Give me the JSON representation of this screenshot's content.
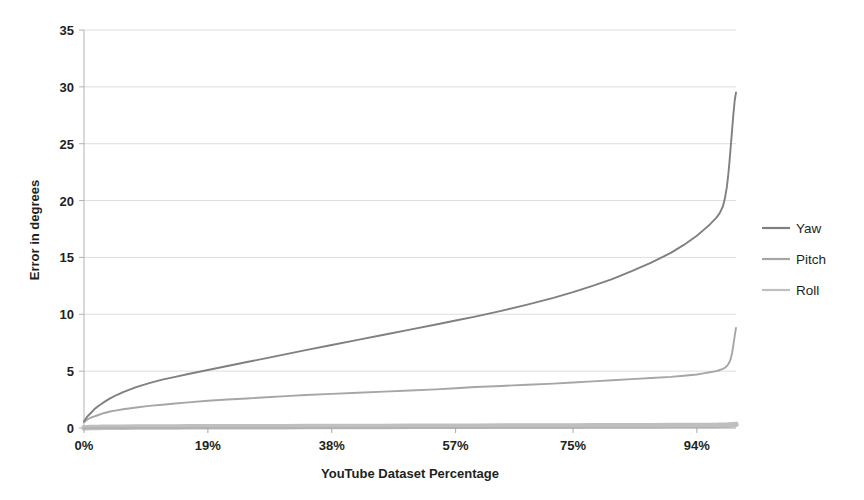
{
  "chart_data": {
    "type": "line",
    "title": "",
    "xlabel": "YouTube Dataset Percentage",
    "ylabel": "Error in degrees",
    "xtick_labels": [
      "0%",
      "19%",
      "38%",
      "57%",
      "75%",
      "94%"
    ],
    "xtick_values": [
      0,
      19,
      38,
      57,
      75,
      94
    ],
    "ytick_labels": [
      "0",
      "5",
      "10",
      "15",
      "20",
      "25",
      "30",
      "35"
    ],
    "ytick_values": [
      0,
      5,
      10,
      15,
      20,
      25,
      30,
      35
    ],
    "xlim": [
      0,
      100
    ],
    "ylim": [
      0,
      35
    ],
    "grid": "horizontal",
    "legend_position": "right",
    "legend": [
      "Yaw",
      "Pitch",
      "Roll"
    ],
    "colors": {
      "yaw": "#808080",
      "pitch": "#a6a6a6",
      "roll": "#bfbfbf",
      "axis": "#808080",
      "grid": "#d9d9d9",
      "text": "#231f20"
    },
    "x": [
      0,
      0.5,
      1,
      1.5,
      2,
      3,
      4,
      5,
      6,
      8,
      10,
      12,
      14,
      16,
      19,
      22,
      25,
      28,
      31,
      34,
      38,
      42,
      46,
      50,
      54,
      57,
      60,
      64,
      68,
      72,
      75,
      78,
      81,
      84,
      87,
      90,
      92,
      94,
      95,
      96,
      97,
      97.5,
      98,
      98.3,
      98.6,
      98.8,
      99,
      99.2,
      99.4,
      99.6,
      99.8,
      100
    ],
    "series": [
      {
        "name": "Yaw",
        "values": [
          0.6,
          1.0,
          1.3,
          1.6,
          1.85,
          2.25,
          2.6,
          2.9,
          3.15,
          3.6,
          3.95,
          4.25,
          4.5,
          4.75,
          5.1,
          5.45,
          5.8,
          6.15,
          6.5,
          6.85,
          7.3,
          7.75,
          8.2,
          8.65,
          9.1,
          9.45,
          9.8,
          10.3,
          10.85,
          11.45,
          11.95,
          12.5,
          13.1,
          13.8,
          14.55,
          15.4,
          16.1,
          16.9,
          17.4,
          17.9,
          18.5,
          18.9,
          19.5,
          20.2,
          21.2,
          22.2,
          23.4,
          24.8,
          26.2,
          27.6,
          28.8,
          29.5
        ]
      },
      {
        "name": "Pitch",
        "values": [
          0.5,
          0.75,
          0.9,
          1.0,
          1.1,
          1.3,
          1.45,
          1.55,
          1.65,
          1.8,
          1.95,
          2.05,
          2.15,
          2.25,
          2.4,
          2.5,
          2.6,
          2.7,
          2.8,
          2.9,
          3.0,
          3.1,
          3.2,
          3.3,
          3.4,
          3.5,
          3.6,
          3.7,
          3.8,
          3.9,
          4.0,
          4.1,
          4.2,
          4.3,
          4.4,
          4.5,
          4.6,
          4.7,
          4.8,
          4.9,
          5.0,
          5.1,
          5.2,
          5.3,
          5.45,
          5.6,
          5.8,
          6.1,
          6.6,
          7.3,
          8.1,
          8.8
        ]
      },
      {
        "name": "Roll",
        "values": [
          0.02,
          0.03,
          0.04,
          0.05,
          0.05,
          0.06,
          0.06,
          0.07,
          0.07,
          0.08,
          0.08,
          0.09,
          0.09,
          0.1,
          0.1,
          0.11,
          0.11,
          0.12,
          0.12,
          0.13,
          0.13,
          0.14,
          0.14,
          0.15,
          0.15,
          0.16,
          0.16,
          0.17,
          0.17,
          0.18,
          0.18,
          0.19,
          0.19,
          0.2,
          0.2,
          0.21,
          0.21,
          0.22,
          0.22,
          0.23,
          0.23,
          0.24,
          0.24,
          0.25,
          0.25,
          0.26,
          0.26,
          0.27,
          0.28,
          0.29,
          0.3,
          0.32
        ]
      }
    ]
  }
}
